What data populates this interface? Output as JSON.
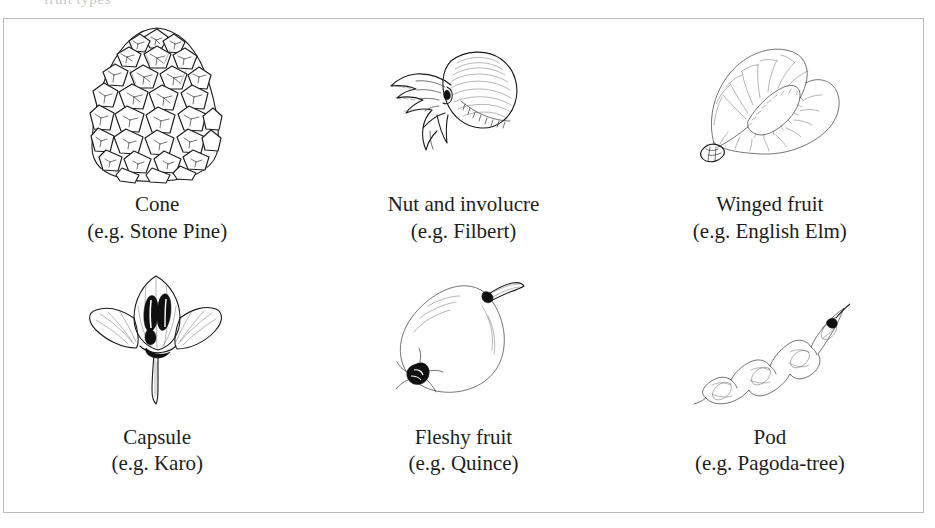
{
  "figure": {
    "type": "botanical-illustration-plate",
    "border_color": "#b9b9bb",
    "background_color": "#ffffff",
    "text_color": "#1e1e1e",
    "bleed_text": "fruit types",
    "columns": 3,
    "rows": 2
  },
  "items": [
    {
      "id": "cone",
      "name": "Cone",
      "example": "(e.g. Stone Pine)",
      "illustration": "pine-cone-illustration"
    },
    {
      "id": "nut-and-involucre",
      "name": "Nut and involucre",
      "example": "(e.g. Filbert)",
      "illustration": "hazelnut-involucre-illustration"
    },
    {
      "id": "winged-fruit",
      "name": "Winged fruit",
      "example": "(e.g. English Elm)",
      "illustration": "elm-samara-illustration"
    },
    {
      "id": "capsule",
      "name": "Capsule",
      "example": "(e.g. Karo)",
      "illustration": "karo-capsule-illustration"
    },
    {
      "id": "fleshy-fruit",
      "name": "Fleshy fruit",
      "example": "(e.g. Quince)",
      "illustration": "quince-fruit-illustration"
    },
    {
      "id": "pod",
      "name": "Pod",
      "example": "(e.g. Pagoda-tree)",
      "illustration": "pagoda-tree-pod-illustration"
    }
  ]
}
